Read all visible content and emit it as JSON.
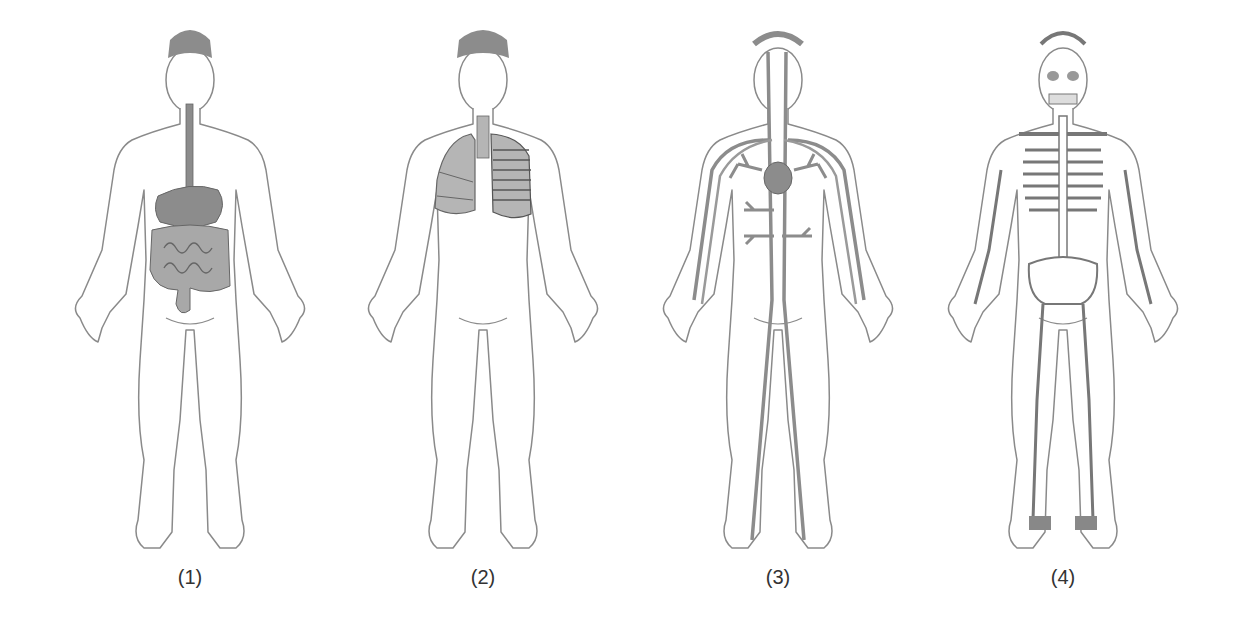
{
  "figure": {
    "colors": {
      "outline": "#8a8a8a",
      "organ_fill": "#8c8c8c",
      "organ_light": "#b5b5b5",
      "label": "#333333"
    },
    "panels": [
      {
        "label": "(1)",
        "system": "digestive system"
      },
      {
        "label": "(2)",
        "system": "respiratory system"
      },
      {
        "label": "(3)",
        "system": "circulatory system"
      },
      {
        "label": "(4)",
        "system": "skeletal system"
      }
    ]
  }
}
